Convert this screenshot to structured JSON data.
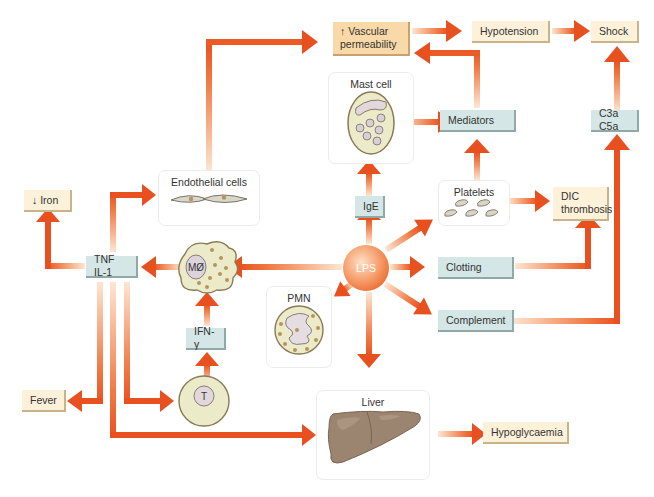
{
  "diagram": {
    "type": "flowchart",
    "colors": {
      "arrow": "#e9501f",
      "arrow_fade": "#fbd2b4",
      "teal_box": "#d4e7e6",
      "cream_box": "#fdf1d9",
      "peach_box": "#f9d9a8",
      "lps_center": "#ec6a2f"
    },
    "nodes": {
      "lps": "LPS",
      "vascular_permeability": "↑ Vascular permeability",
      "vascular_line1": "↑ Vascular",
      "vascular_line2": "permeability",
      "hypotension": "Hypotension",
      "shock": "Shock",
      "mast_cell": "Mast cell",
      "mediators": "Mediators",
      "c3a_c5a": "C3a C5a",
      "endothelial_cells": "Endothelial cells",
      "iron": "↓ Iron",
      "tnf_il1": "TNF IL-1",
      "macrophage": "MØ",
      "ige": "IgE",
      "platelets": "Platelets",
      "dic_line1": "DIC",
      "dic_line2": "thrombosis",
      "clotting": "Clotting",
      "complement": "Complement",
      "pmn": "PMN",
      "ifn_gamma": "IFN-γ",
      "t_cell": "T",
      "fever": "Fever",
      "liver": "Liver",
      "hypoglycaemia": "Hypoglycaemia"
    },
    "edges": [
      [
        "LPS",
        "IgE"
      ],
      [
        "IgE",
        "Mast cell"
      ],
      [
        "Mast cell",
        "Mediators"
      ],
      [
        "Mediators",
        "↑ Vascular permeability"
      ],
      [
        "↑ Vascular permeability",
        "Hypotension"
      ],
      [
        "Hypotension",
        "Shock"
      ],
      [
        "C3a C5a",
        "Shock"
      ],
      [
        "LPS",
        "Platelets"
      ],
      [
        "Platelets",
        "Mediators"
      ],
      [
        "Platelets",
        "DIC thrombosis"
      ],
      [
        "LPS",
        "Clotting"
      ],
      [
        "Clotting",
        "DIC thrombosis"
      ],
      [
        "LPS",
        "Complement"
      ],
      [
        "Complement",
        "C3a C5a"
      ],
      [
        "LPS",
        "MØ"
      ],
      [
        "LPS",
        "PMN"
      ],
      [
        "LPS",
        "Liver"
      ],
      [
        "MØ",
        "TNF IL-1"
      ],
      [
        "IFN-γ",
        "MØ"
      ],
      [
        "T",
        "IFN-γ"
      ],
      [
        "TNF IL-1",
        "↓ Iron"
      ],
      [
        "TNF IL-1",
        "Endothelial cells"
      ],
      [
        "Endothelial cells",
        "↑ Vascular permeability"
      ],
      [
        "TNF IL-1",
        "Fever"
      ],
      [
        "TNF IL-1",
        "T"
      ],
      [
        "TNF IL-1",
        "Liver"
      ],
      [
        "Liver",
        "Hypoglycaemia"
      ]
    ]
  }
}
